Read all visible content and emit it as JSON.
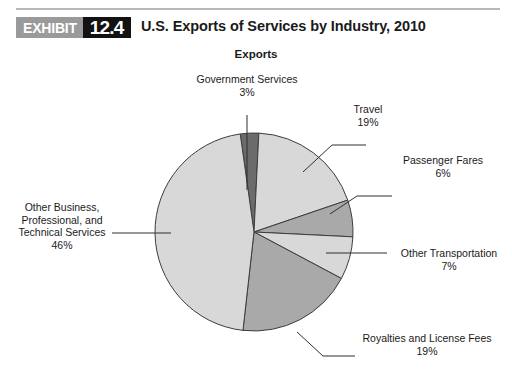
{
  "exhibit": {
    "tag": "EXHIBIT",
    "number": "12.4",
    "title": "U.S. Exports of Services by Industry, 2010",
    "tag_bg": "#9a9a9a",
    "number_bg": "#121212",
    "rule_color": "#b9b9b9"
  },
  "chart_data": {
    "type": "pie",
    "title": "Exports",
    "xlabel": "",
    "ylabel": "",
    "legend_position": "none",
    "grid": false,
    "value_unit": "percent",
    "categories": [
      "Government Services",
      "Travel",
      "Passenger Fares",
      "Other Transportation",
      "Royalties and License Fees",
      "Other Business, Professional, and Technical Services"
    ],
    "values": [
      3,
      19,
      6,
      7,
      19,
      46
    ],
    "slices": [
      {
        "label": "Government Services",
        "label_lines": [
          "Government Services"
        ],
        "value": 3,
        "value_text": "3%",
        "color": "#6b6b6b",
        "start_angle": 352,
        "end_angle": 363
      },
      {
        "label": "Travel",
        "label_lines": [
          "Travel"
        ],
        "value": 19,
        "value_text": "19%",
        "color": "#d8d8d8",
        "start_angle": 363,
        "end_angle": 431
      },
      {
        "label": "Passenger Fares",
        "label_lines": [
          "Passenger Fares"
        ],
        "value": 6,
        "value_text": "6%",
        "color": "#a9a9a9",
        "start_angle": 431,
        "end_angle": 453
      },
      {
        "label": "Other Transportation",
        "label_lines": [
          "Other Transportation"
        ],
        "value": 7,
        "value_text": "7%",
        "color": "#d8d8d8",
        "start_angle": 453,
        "end_angle": 478
      },
      {
        "label": "Royalties and License Fees",
        "label_lines": [
          "Royalties and License Fees"
        ],
        "value": 19,
        "value_text": "19%",
        "color": "#a9a9a9",
        "start_angle": 478,
        "end_angle": 546
      },
      {
        "label": "Other Business, Professional, and Technical Services",
        "label_lines": [
          "Other Business,",
          "Professional, and",
          "Technical Services"
        ],
        "value": 46,
        "value_text": "46%",
        "color": "#d8d8d8",
        "start_angle": 546,
        "end_angle": 712
      }
    ],
    "outline_color": "#3c3c3c",
    "leader_color": "#2f2f2f"
  },
  "labels": {
    "government_services": {
      "line1": "Government Services",
      "pct": "3%"
    },
    "travel": {
      "line1": "Travel",
      "pct": "19%"
    },
    "passenger_fares": {
      "line1": "Passenger Fares",
      "pct": "6%"
    },
    "other_transportation": {
      "line1": "Other Transportation",
      "pct": "7%"
    },
    "royalties": {
      "line1": "Royalties and License Fees",
      "pct": "19%"
    },
    "other_business": {
      "line1": "Other Business,",
      "line2": "Professional, and",
      "line3": "Technical Services",
      "pct": "46%"
    }
  }
}
